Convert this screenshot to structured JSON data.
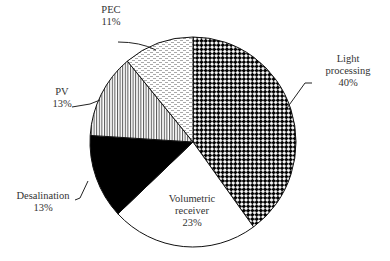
{
  "chart_data": {
    "type": "pie",
    "title": "",
    "start_angle": "12 o'clock",
    "direction": "clockwise",
    "legend": "none (direct labels with leader lines)",
    "slices": [
      {
        "label": "Light processing",
        "value": 40,
        "value_label": "40%",
        "pattern": "checkerboard-dots"
      },
      {
        "label": "Volumetric receiver",
        "value": 23,
        "value_label": "23%",
        "pattern": "white"
      },
      {
        "label": "Desalination",
        "value": 13,
        "value_label": "13%",
        "pattern": "solid-black"
      },
      {
        "label": "PV",
        "value": 13,
        "value_label": "13%",
        "pattern": "vertical-stripes"
      },
      {
        "label": "PEC",
        "value": 11,
        "value_label": "11%",
        "pattern": "light-dashes"
      }
    ]
  },
  "labels": {
    "light": {
      "line1": "Light",
      "line2": "processing",
      "pct": "40%"
    },
    "volumetric": {
      "line1": "Volumetric",
      "line2": "receiver",
      "pct": "23%"
    },
    "desalination": {
      "line1": "Desalination",
      "pct": "13%"
    },
    "pv": {
      "line1": "PV",
      "pct": "13%"
    },
    "pec": {
      "line1": "PEC",
      "pct": "11%"
    }
  }
}
